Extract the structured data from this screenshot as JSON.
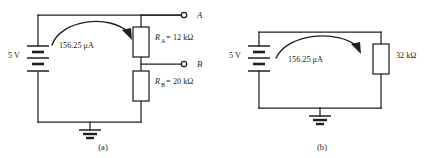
{
  "figure": {
    "background_color": "#ffffff",
    "line_color": "#231f20",
    "panels": [
      {
        "id": "a",
        "caption": "(a)",
        "source": {
          "label": "5 V",
          "type": "battery-symbol",
          "cells": 3
        },
        "current": {
          "label": "156.25 μA",
          "direction": "clockwise-from-source"
        },
        "components": [
          {
            "name": "R_A",
            "symbol_prefix": "R",
            "symbol_subscript": "A",
            "equals": "=",
            "value": "12 kΩ",
            "full_label": "R_A = 12 kΩ"
          },
          {
            "name": "R_B",
            "symbol_prefix": "R",
            "symbol_subscript": "B",
            "equals": "=",
            "value": "20 kΩ",
            "full_label": "R_B = 20 kΩ"
          }
        ],
        "terminals": [
          {
            "label": "A",
            "position": "top-right"
          },
          {
            "label": "B",
            "position": "mid-right"
          }
        ],
        "ground": true
      },
      {
        "id": "b",
        "caption": "(b)",
        "source": {
          "label": "5 V",
          "type": "battery-symbol",
          "cells": 3
        },
        "current": {
          "label": "156.25 μA",
          "direction": "clockwise-from-source"
        },
        "components": [
          {
            "name": "R_equivalent",
            "symbol_prefix": "",
            "symbol_subscript": "",
            "equals": "",
            "value": "32 kΩ",
            "full_label": "32 kΩ"
          }
        ],
        "terminals": [],
        "ground": true
      }
    ]
  }
}
